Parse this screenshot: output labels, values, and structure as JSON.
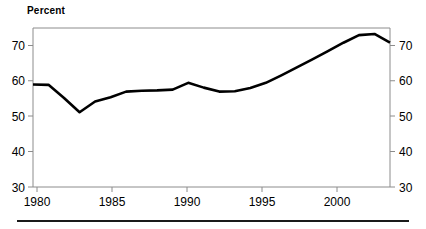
{
  "chart": {
    "axis_title": "Percent",
    "y_axis_left_labels": [
      "70",
      "60",
      "50",
      "40",
      "30"
    ],
    "y_axis_right_labels": [
      "70",
      "60",
      "50",
      "40",
      "30"
    ],
    "x_axis_labels": [
      "1980",
      "1985",
      "1990",
      "1995",
      "2000"
    ],
    "line_color": "#000000",
    "frame_color": "#8c8c8c",
    "rule_color": "#1a1a1a",
    "background_color": "#ffffff"
  },
  "chart_data": {
    "type": "line",
    "title": "",
    "subtitle": "",
    "xlabel": "",
    "ylabel": "Percent",
    "xlim": [
      1980,
      2003
    ],
    "ylim": [
      30,
      70
    ],
    "xticks": [
      1980,
      1985,
      1990,
      1995,
      2000
    ],
    "yticks": [
      30,
      40,
      50,
      60,
      70
    ],
    "grid": false,
    "legend": null,
    "y_axis_duplicated_right": true,
    "x": [
      1980,
      1981,
      1982,
      1983,
      1984,
      1985,
      1986,
      1987,
      1988,
      1989,
      1990,
      1991,
      1992,
      1993,
      1994,
      1995,
      1996,
      1997,
      1998,
      1999,
      2000,
      2001,
      2002,
      2003
    ],
    "values": [
      55.8,
      55.7,
      52.4,
      48.8,
      51.5,
      52.6,
      54.0,
      54.2,
      54.3,
      54.5,
      56.2,
      55.0,
      54.0,
      54.1,
      54.9,
      56.2,
      58.1,
      60.1,
      62.1,
      64.2,
      66.3,
      68.2,
      68.5,
      66.3
    ],
    "series": [
      {
        "name": "Percent",
        "values": [
          55.8,
          55.7,
          52.4,
          48.8,
          51.5,
          52.6,
          54.0,
          54.2,
          54.3,
          54.5,
          56.2,
          55.0,
          54.0,
          54.1,
          54.9,
          56.2,
          58.1,
          60.1,
          62.1,
          64.2,
          66.3,
          68.2,
          68.5,
          66.3
        ]
      }
    ]
  }
}
